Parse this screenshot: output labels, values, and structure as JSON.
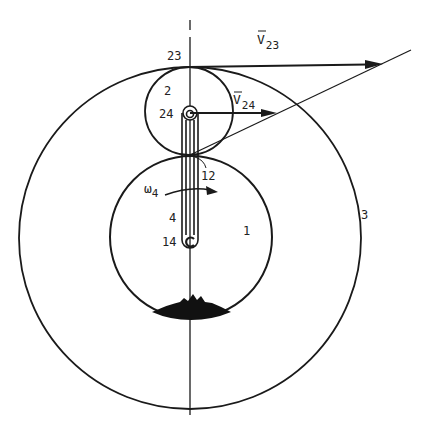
{
  "diagram": {
    "type": "planetary gear train velocity diagram",
    "colors": {
      "ink": "#1a1a1a",
      "background": "#ffffff"
    },
    "bodies": [
      {
        "id": "1",
        "label": "1",
        "description": "sun gear (fixed)",
        "cx": 191,
        "cy": 237,
        "r": 81
      },
      {
        "id": "2",
        "label": "2",
        "description": "planet gear",
        "cx": 189,
        "cy": 111,
        "r": 44
      },
      {
        "id": "3",
        "label": "3",
        "description": "ring gear",
        "cx": 190,
        "cy": 238,
        "r": 171
      },
      {
        "id": "4",
        "label": "4",
        "description": "arm / carrier"
      }
    ],
    "points": {
      "p23": {
        "label": "23",
        "x": 190,
        "y": 67
      },
      "p24": {
        "label": "24",
        "x": 190,
        "y": 113
      },
      "p12": {
        "label": "12",
        "x": 190,
        "y": 155
      },
      "p14": {
        "label": "14",
        "x": 190,
        "y": 240
      }
    },
    "labels": {
      "l23": "23",
      "l2": "2",
      "l24": "24",
      "l12": "12",
      "l4": "4",
      "l14": "14",
      "l1": "1",
      "l3": "3",
      "omega": "ω",
      "omega_sub": "4",
      "v23_main": "V",
      "v23_sub": "23",
      "v24_main": "V",
      "v24_sub": "24"
    },
    "vectors": [
      {
        "name": "V23",
        "from": [
          190,
          67
        ],
        "to": [
          383,
          64
        ]
      },
      {
        "name": "V24",
        "from": [
          190,
          113
        ],
        "to": [
          277,
          113
        ]
      }
    ],
    "velocity_line": {
      "from": [
        190,
        155
      ],
      "to": [
        411,
        50
      ]
    },
    "angular_velocity": {
      "symbol": "ω4",
      "direction": "clockwise"
    }
  }
}
